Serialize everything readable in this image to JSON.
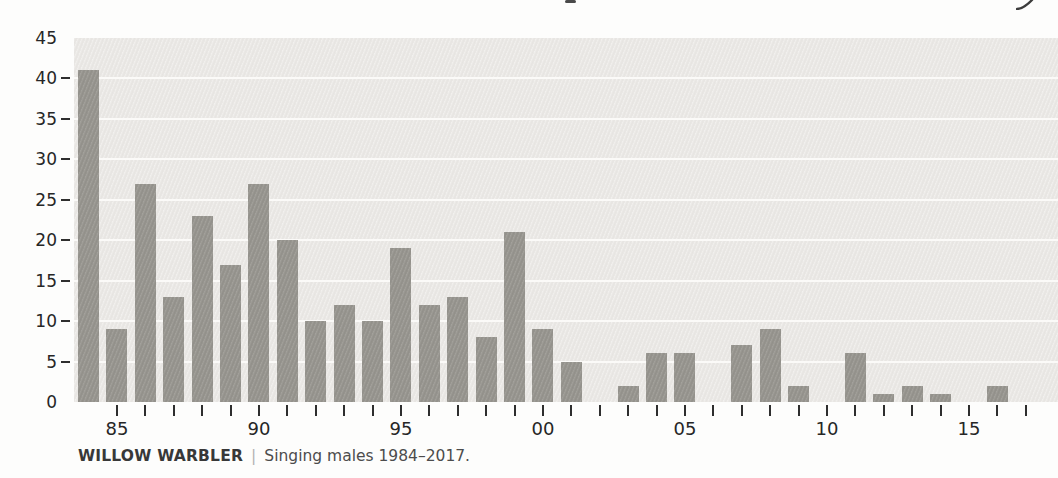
{
  "caption": {
    "species": "WILLOW WARBLER",
    "separator": "|",
    "description": "Singing males 1984–2017."
  },
  "chart_data": {
    "type": "bar",
    "series_name": "Singing males",
    "x": [
      1984,
      1985,
      1986,
      1987,
      1988,
      1989,
      1990,
      1991,
      1992,
      1993,
      1994,
      1995,
      1996,
      1997,
      1998,
      1999,
      2000,
      2001,
      2002,
      2003,
      2004,
      2005,
      2006,
      2007,
      2008,
      2009,
      2010,
      2011,
      2012,
      2013,
      2014,
      2015,
      2016,
      2017
    ],
    "values": [
      41,
      9,
      27,
      13,
      23,
      17,
      27,
      20,
      10,
      12,
      10,
      19,
      12,
      13,
      8,
      21,
      9,
      5,
      0,
      2,
      6,
      6,
      0,
      7,
      9,
      2,
      0,
      6,
      1,
      2,
      1,
      0,
      2,
      0
    ],
    "xlabel": "",
    "ylabel": "",
    "ylim": [
      0,
      45
    ],
    "y_ticks": [
      0,
      5,
      10,
      15,
      20,
      25,
      30,
      35,
      40,
      45
    ],
    "x_axis_labels": [
      {
        "year": 1985,
        "label": "85"
      },
      {
        "year": 1990,
        "label": "90"
      },
      {
        "year": 1995,
        "label": "95"
      },
      {
        "year": 2000,
        "label": "00"
      },
      {
        "year": 2005,
        "label": "05"
      },
      {
        "year": 2010,
        "label": "10"
      },
      {
        "year": 2015,
        "label": "15"
      }
    ],
    "grid": "horizontal white lines every 5, plot background shaded",
    "legend": "none",
    "bar_color": "#999791",
    "plot_background": "#ebe9e6",
    "gridline_color": "#fbfaf8",
    "axis_text_color": "#262626"
  }
}
